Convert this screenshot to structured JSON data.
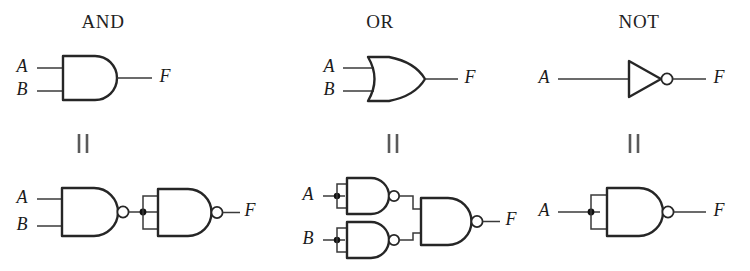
{
  "figure": {
    "background_color": "#ffffff",
    "line_color": "#262626",
    "wire_color": "#3a3a3a",
    "equivalence_symbol": "||",
    "columns": [
      {
        "id": "and",
        "title": "AND",
        "title_x": 103,
        "equivalence_x": 83,
        "top_gate": {
          "type": "and-gate",
          "inputs": [
            "A",
            "B"
          ],
          "output": "F"
        },
        "bottom_circuit": {
          "description": "two NAND gates: NAND(A,B) feeding a NAND wired as inverter",
          "gates": [
            "nand-gate",
            "nand-gate"
          ],
          "inputs": [
            "A",
            "B"
          ],
          "output": "F",
          "junctions": 1
        }
      },
      {
        "id": "or",
        "title": "OR",
        "title_x": 380,
        "equivalence_x": 393,
        "top_gate": {
          "type": "or-gate",
          "inputs": [
            "A",
            "B"
          ],
          "output": "F"
        },
        "bottom_circuit": {
          "description": "two NAND inverters feeding a NAND gate",
          "gates": [
            "nand-gate",
            "nand-gate",
            "nand-gate"
          ],
          "inputs": [
            "A",
            "B"
          ],
          "output": "F",
          "junctions": 2
        }
      },
      {
        "id": "not",
        "title": "NOT",
        "title_x": 639,
        "equivalence_x": 634,
        "top_gate": {
          "type": "not-gate",
          "inputs": [
            "A"
          ],
          "output": "F"
        },
        "bottom_circuit": {
          "description": "single NAND gate with both inputs tied together",
          "gates": [
            "nand-gate"
          ],
          "inputs": [
            "A"
          ],
          "output": "F",
          "junctions": 1
        }
      }
    ],
    "labels": {
      "input_a": "A",
      "input_b": "B",
      "output_f": "F"
    }
  }
}
